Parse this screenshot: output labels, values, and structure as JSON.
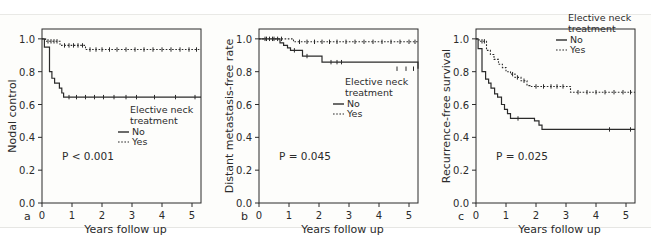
{
  "figure": {
    "type": "kaplan-meier-survival-curves",
    "panel_count": 3,
    "background": "#ffffff",
    "line_color": "#2b2b2b"
  },
  "legend": {
    "title_line1": "Elective neck",
    "title_line2": "treatment",
    "entries": [
      {
        "label": "No",
        "style": "solid"
      },
      {
        "label": "Yes",
        "style": "dotted"
      }
    ]
  },
  "axis": {
    "xlabel": "Years follow up",
    "xticks": [
      "0",
      "1",
      "2",
      "3",
      "4",
      "5"
    ],
    "yticks": [
      "0.0",
      "0.2",
      "0.4",
      "0.6",
      "0.8",
      "1.0"
    ]
  },
  "panels": [
    {
      "letter": "a",
      "ylabel": "Nodal control",
      "pvalue": "P < 0.001"
    },
    {
      "letter": "b",
      "ylabel": "Distant metastasis-free rate",
      "pvalue": "P = 0.045"
    },
    {
      "letter": "c",
      "ylabel": "Recurrence-free survival",
      "pvalue": "P = 0.025"
    }
  ],
  "chart_data": [
    {
      "type": "line",
      "panel": "a",
      "title": "",
      "xlabel": "Years follow up",
      "ylabel": "Nodal control",
      "xlim": [
        0,
        5.3
      ],
      "ylim": [
        0.0,
        1.06
      ],
      "xticks": [
        0,
        1,
        2,
        3,
        4,
        5
      ],
      "yticks": [
        0.0,
        0.2,
        0.4,
        0.6,
        0.8,
        1.0
      ],
      "grid": false,
      "legend_position": "lower-right",
      "annotations": [
        "P < 0.001"
      ],
      "series": [
        {
          "name": "No",
          "style": "solid",
          "x": [
            0,
            0.08,
            0.15,
            0.25,
            0.33,
            0.42,
            0.5,
            0.58,
            0.66,
            0.72,
            5.3
          ],
          "y": [
            1.0,
            0.95,
            0.95,
            0.8,
            0.76,
            0.73,
            0.73,
            0.7,
            0.67,
            0.645,
            0.645
          ],
          "censor_x": [
            0.9,
            1.15,
            1.45,
            1.75,
            2.05,
            2.4,
            2.8,
            3.15,
            3.75,
            4.45,
            5.1
          ],
          "censor_y": [
            0.645,
            0.645,
            0.645,
            0.645,
            0.645,
            0.645,
            0.645,
            0.645,
            0.645,
            0.645,
            0.645
          ]
        },
        {
          "name": "Yes",
          "style": "dotted",
          "x": [
            0,
            0.12,
            0.6,
            1.45,
            5.3
          ],
          "y": [
            1.0,
            0.985,
            0.96,
            0.935,
            0.935
          ],
          "censor_x": [
            0.2,
            0.3,
            0.4,
            0.5,
            0.75,
            0.9,
            1.05,
            1.2,
            1.35,
            1.6,
            1.8,
            2.0,
            2.25,
            2.5,
            2.8,
            3.1,
            3.4,
            3.7,
            4.0,
            4.3,
            4.6,
            4.9,
            5.15
          ],
          "censor_y": [
            0.985,
            0.985,
            0.985,
            0.985,
            0.96,
            0.96,
            0.96,
            0.96,
            0.96,
            0.935,
            0.935,
            0.935,
            0.935,
            0.935,
            0.935,
            0.935,
            0.935,
            0.935,
            0.935,
            0.935,
            0.935,
            0.935,
            0.935
          ]
        }
      ]
    },
    {
      "type": "line",
      "panel": "b",
      "title": "",
      "xlabel": "Years follow up",
      "ylabel": "Distant metastasis-free rate",
      "xlim": [
        0,
        5.3
      ],
      "ylim": [
        0.0,
        1.06
      ],
      "xticks": [
        0,
        1,
        2,
        3,
        4,
        5
      ],
      "yticks": [
        0.0,
        0.2,
        0.4,
        0.6,
        0.8,
        1.0
      ],
      "grid": false,
      "legend_position": "middle-right",
      "annotations": [
        "P = 0.045"
      ],
      "series": [
        {
          "name": "No",
          "style": "solid",
          "x": [
            0,
            0.62,
            0.7,
            0.82,
            0.95,
            1.05,
            1.3,
            1.45,
            2.1,
            4.2,
            5.3
          ],
          "y": [
            1.0,
            1.0,
            0.975,
            0.96,
            0.945,
            0.93,
            0.93,
            0.895,
            0.858,
            0.858,
            0.818
          ],
          "censor_x": [
            0.2,
            0.35,
            0.5,
            1.18,
            1.6,
            2.4,
            2.6,
            2.75,
            4.6,
            4.9,
            5.15
          ],
          "censor_y": [
            1.0,
            1.0,
            1.0,
            0.93,
            0.895,
            0.858,
            0.858,
            0.858,
            0.818,
            0.818,
            0.818
          ]
        },
        {
          "name": "Yes",
          "style": "dotted",
          "x": [
            0,
            0.85,
            1.15,
            5.3
          ],
          "y": [
            1.0,
            1.0,
            0.982,
            0.982
          ],
          "censor_x": [
            0.25,
            0.45,
            0.62,
            0.75,
            1.35,
            1.6,
            1.85,
            2.1,
            2.35,
            2.6,
            2.9,
            3.2,
            3.5,
            3.8,
            4.1,
            4.4,
            4.7,
            5.0,
            5.2
          ],
          "censor_y": [
            1.0,
            1.0,
            1.0,
            1.0,
            0.982,
            0.982,
            0.982,
            0.982,
            0.982,
            0.982,
            0.982,
            0.982,
            0.982,
            0.982,
            0.982,
            0.982,
            0.982,
            0.982,
            0.982
          ]
        }
      ]
    },
    {
      "type": "line",
      "panel": "c",
      "title": "",
      "xlabel": "Years follow up",
      "ylabel": "Recurrence-free survival",
      "xlim": [
        0,
        5.3
      ],
      "ylim": [
        0.0,
        1.06
      ],
      "xticks": [
        0,
        1,
        2,
        3,
        4,
        5
      ],
      "yticks": [
        0.0,
        0.2,
        0.4,
        0.6,
        0.8,
        1.0
      ],
      "grid": false,
      "legend_position": "upper-right",
      "annotations": [
        "P = 0.025"
      ],
      "series": [
        {
          "name": "No",
          "style": "solid",
          "x": [
            0,
            0.07,
            0.2,
            0.32,
            0.42,
            0.5,
            0.62,
            0.72,
            0.85,
            0.95,
            1.05,
            1.15,
            1.75,
            1.95,
            2.1,
            2.2,
            5.3
          ],
          "y": [
            1.0,
            0.94,
            0.8,
            0.755,
            0.73,
            0.7,
            0.665,
            0.645,
            0.6,
            0.57,
            0.545,
            0.515,
            0.515,
            0.5,
            0.475,
            0.448,
            0.448
          ],
          "censor_x": [
            1.4,
            4.45,
            5.15
          ],
          "censor_y": [
            0.515,
            0.448,
            0.448
          ]
        },
        {
          "name": "Yes",
          "style": "dotted",
          "x": [
            0,
            0.1,
            0.35,
            0.48,
            0.6,
            0.75,
            0.88,
            1.0,
            1.15,
            1.3,
            1.5,
            1.7,
            1.8,
            3.05,
            3.15,
            5.3
          ],
          "y": [
            1.0,
            0.985,
            0.93,
            0.905,
            0.875,
            0.845,
            0.825,
            0.8,
            0.785,
            0.765,
            0.745,
            0.715,
            0.71,
            0.71,
            0.675,
            0.675
          ],
          "censor_x": [
            0.2,
            0.28,
            1.22,
            1.38,
            1.6,
            2.0,
            2.25,
            2.5,
            2.7,
            2.9,
            3.4,
            3.7,
            4.0,
            4.3,
            4.6,
            4.9,
            5.15
          ],
          "censor_y": [
            0.985,
            0.985,
            0.785,
            0.765,
            0.745,
            0.71,
            0.71,
            0.71,
            0.71,
            0.71,
            0.675,
            0.675,
            0.675,
            0.675,
            0.675,
            0.675,
            0.675
          ]
        }
      ]
    }
  ]
}
